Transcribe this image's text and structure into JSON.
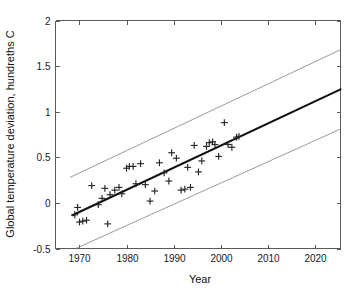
{
  "chart_data": {
    "type": "scatter",
    "title": "",
    "xlabel": "Year",
    "ylabel": "Global temperature deviation, hundreths C",
    "xlim": [
      1964.9,
      1965.0
    ],
    "xlim_values": [
      1964.9,
      2025.5
    ],
    "ylim": [
      -0.5,
      2
    ],
    "grid": false,
    "legend": false,
    "x_ticks": [
      1970,
      1980,
      1990,
      2000,
      2010,
      2020
    ],
    "x_tick_labels": [
      "1970",
      "1980",
      "1990",
      "2000",
      "2010",
      "2020"
    ],
    "y_ticks": [
      -0.5,
      0,
      0.5,
      1,
      1.5,
      2
    ],
    "y_tick_labels": [
      "-0.5",
      "0",
      "0.5",
      "1",
      "1.5",
      "2"
    ],
    "series": [
      {
        "name": "observations",
        "type": "scatter",
        "marker": "plus",
        "color": "#262626",
        "points": [
          [
            1969,
            -0.13
          ],
          [
            1969.6,
            -0.05
          ],
          [
            1970,
            -0.21
          ],
          [
            1970.7,
            -0.2
          ],
          [
            1971.5,
            -0.19
          ],
          [
            1972.6,
            0.19
          ],
          [
            1974,
            -0.02
          ],
          [
            1974.8,
            0.05
          ],
          [
            1975.4,
            0.16
          ],
          [
            1976,
            -0.23
          ],
          [
            1976.5,
            0.09
          ],
          [
            1977.5,
            0.14
          ],
          [
            1978.4,
            0.17
          ],
          [
            1979,
            0.1
          ],
          [
            1980,
            0.38
          ],
          [
            1980.6,
            0.4
          ],
          [
            1981.4,
            0.4
          ],
          [
            1982,
            0.21
          ],
          [
            1983,
            0.43
          ],
          [
            1984,
            0.2
          ],
          [
            1985,
            0.02
          ],
          [
            1986,
            0.13
          ],
          [
            1987,
            0.44
          ],
          [
            1988,
            0.33
          ],
          [
            1989,
            0.24
          ],
          [
            1989.6,
            0.55
          ],
          [
            1990.6,
            0.49
          ],
          [
            1991.6,
            0.14
          ],
          [
            1992.4,
            0.15
          ],
          [
            1993,
            0.39
          ],
          [
            1993.6,
            0.17
          ],
          [
            1994.4,
            0.63
          ],
          [
            1995.3,
            0.34
          ],
          [
            1996,
            0.46
          ],
          [
            1997,
            0.62
          ],
          [
            1997.6,
            0.66
          ],
          [
            1998.3,
            0.67
          ],
          [
            1998.8,
            0.64
          ],
          [
            1999.6,
            0.51
          ],
          [
            2000.8,
            0.88
          ],
          [
            2001.6,
            0.64
          ],
          [
            2002.4,
            0.61
          ],
          [
            2003.4,
            0.72
          ],
          [
            2003.9,
            0.73
          ]
        ]
      },
      {
        "name": "regression-fit",
        "type": "line",
        "color": "#111111",
        "x_start": 1968.5,
        "y_start": -0.135,
        "x_end": 2025.5,
        "y_end": 1.245
      },
      {
        "name": "upper-prediction-band",
        "type": "line",
        "color": "#8e8e8e",
        "x_start": 1968.0,
        "y_start": 0.28,
        "x_end": 2025.5,
        "y_end": 1.68
      },
      {
        "name": "lower-prediction-band",
        "type": "line",
        "color": "#8e8e8e",
        "x_start": 1969.2,
        "y_start": -0.5,
        "x_end": 2025.5,
        "y_end": 0.81
      }
    ]
  },
  "axes": {
    "xlabel": "Year",
    "ylabel": "Global temperature deviation, hundreths C"
  }
}
